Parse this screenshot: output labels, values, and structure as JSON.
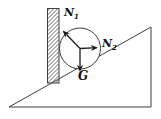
{
  "figure": {
    "background": "#ffffff",
    "line_color": "#3f3f3f",
    "vector_color": "#1c1c1c",
    "labels": {
      "n1": {
        "symbol": "N",
        "subscript": "1"
      },
      "n2": {
        "symbol": "N",
        "subscript": "2"
      },
      "g": {
        "symbol": "G",
        "subscript": ""
      }
    }
  }
}
